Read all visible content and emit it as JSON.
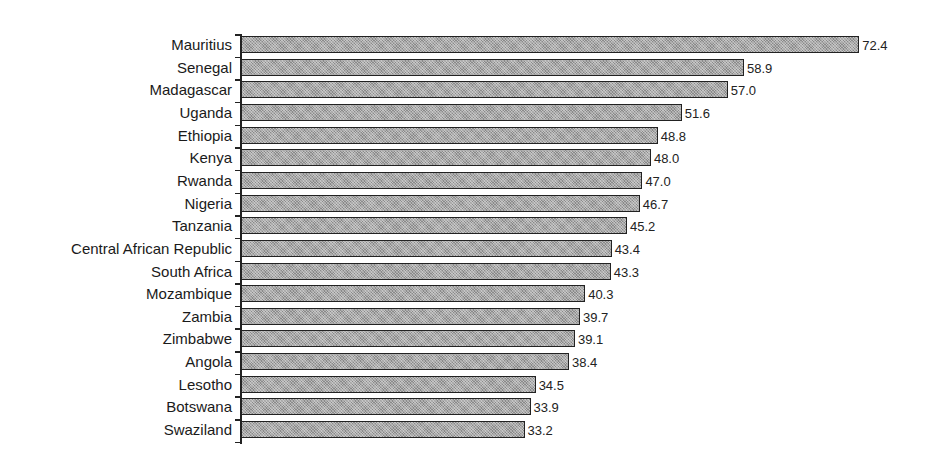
{
  "chart_data": {
    "type": "bar",
    "orientation": "horizontal",
    "title": "",
    "xlabel": "",
    "ylabel": "",
    "categories": [
      "Mauritius",
      "Senegal",
      "Madagascar",
      "Uganda",
      "Ethiopia",
      "Kenya",
      "Rwanda",
      "Nigeria",
      "Tanzania",
      "Central African Republic",
      "South Africa",
      "Mozambique",
      "Zambia",
      "Zimbabwe",
      "Angola",
      "Lesotho",
      "Botswana",
      "Swaziland"
    ],
    "values": [
      72.4,
      58.9,
      57.0,
      51.6,
      48.8,
      48.0,
      47.0,
      46.7,
      45.2,
      43.4,
      43.3,
      40.3,
      39.7,
      39.1,
      38.4,
      34.5,
      33.9,
      33.2
    ],
    "value_labels": [
      "72.4",
      "58.9",
      "57.0",
      "51.6",
      "48.8",
      "48.0",
      "47.0",
      "46.7",
      "45.2",
      "43.4",
      "43.3",
      "40.3",
      "39.7",
      "39.1",
      "38.4",
      "34.5",
      "33.9",
      "33.2"
    ],
    "xlim": [
      0,
      75
    ],
    "grid": false,
    "legend": null,
    "bar_fill": "#a8a8a8",
    "bar_edge": "#222222"
  }
}
